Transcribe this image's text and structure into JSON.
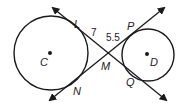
{
  "diagram": {
    "circles": [
      {
        "label": "C",
        "cx": 51,
        "cy": 53,
        "r": 37
      },
      {
        "label": "D",
        "cx": 148,
        "cy": 55,
        "r": 26
      }
    ],
    "points": {
      "L": "L",
      "P": "P",
      "M": "M",
      "N": "N",
      "Q": "Q",
      "C": "C",
      "D": "D"
    },
    "segment_lengths": {
      "LM": "7",
      "MP": "5.5"
    },
    "stroke_color": "#1a1a1a"
  }
}
